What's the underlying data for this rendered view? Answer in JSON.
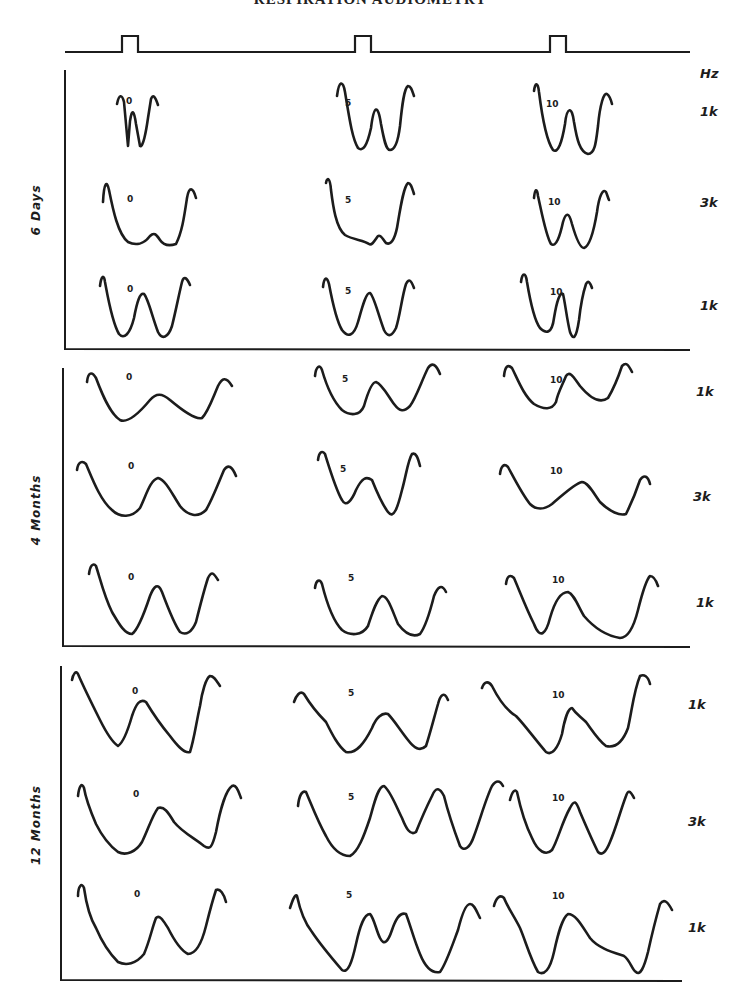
{
  "title": "RESPIRATION AUDIOMETRY",
  "unit_label": "Hz",
  "stimulus": {
    "baseline_y": 52,
    "x_start": 65,
    "x_end": 690,
    "pulses": [
      [
        122,
        138
      ],
      [
        355,
        371
      ],
      [
        550,
        566
      ]
    ],
    "pulse_top_y": 36
  },
  "panels": [
    {
      "label": "6 Days",
      "label_pos": [
        40,
        210
      ],
      "axis": {
        "x": 65,
        "top": 70,
        "bottom": 349,
        "right": 690
      },
      "freq_labels": [
        {
          "text": "1k",
          "x": 700,
          "y": 116
        },
        {
          "text": "3k",
          "x": 700,
          "y": 207
        },
        {
          "text": "1k",
          "x": 700,
          "y": 310
        }
      ],
      "levels": [
        {
          "text": "0",
          "x": 126,
          "y": 104
        },
        {
          "text": "5",
          "x": 345,
          "y": 106
        },
        {
          "text": "10",
          "x": 546,
          "y": 107
        },
        {
          "text": "0",
          "x": 127,
          "y": 202
        },
        {
          "text": "5",
          "x": 345,
          "y": 203
        },
        {
          "text": "10",
          "x": 548,
          "y": 205
        },
        {
          "text": "0",
          "x": 127,
          "y": 292
        },
        {
          "text": "5",
          "x": 345,
          "y": 294
        },
        {
          "text": "10",
          "x": 550,
          "y": 295
        }
      ]
    },
    {
      "label": "4 Months",
      "label_pos": [
        40,
        510
      ],
      "axis": {
        "x": 63,
        "top": 368,
        "bottom": 646,
        "right": 690
      },
      "freq_labels": [
        {
          "text": "1k",
          "x": 696,
          "y": 396
        },
        {
          "text": "3k",
          "x": 693,
          "y": 501
        },
        {
          "text": "1k",
          "x": 696,
          "y": 607
        }
      ],
      "levels": [
        {
          "text": "0",
          "x": 126,
          "y": 380
        },
        {
          "text": "5",
          "x": 342,
          "y": 382
        },
        {
          "text": "10",
          "x": 550,
          "y": 383
        },
        {
          "text": "0",
          "x": 128,
          "y": 469
        },
        {
          "text": "5",
          "x": 340,
          "y": 472
        },
        {
          "text": "10",
          "x": 550,
          "y": 474
        },
        {
          "text": "0",
          "x": 128,
          "y": 580
        },
        {
          "text": "5",
          "x": 348,
          "y": 581
        },
        {
          "text": "10",
          "x": 552,
          "y": 583
        }
      ]
    },
    {
      "label": "12 Months",
      "label_pos": [
        40,
        825
      ],
      "axis": {
        "x": 61,
        "top": 666,
        "bottom": 980,
        "right": 682
      },
      "freq_labels": [
        {
          "text": "1k",
          "x": 688,
          "y": 709
        },
        {
          "text": "3k",
          "x": 688,
          "y": 826
        },
        {
          "text": "1k",
          "x": 688,
          "y": 932
        }
      ],
      "levels": [
        {
          "text": "0",
          "x": 132,
          "y": 694
        },
        {
          "text": "5",
          "x": 348,
          "y": 696
        },
        {
          "text": "10",
          "x": 552,
          "y": 698
        },
        {
          "text": "0",
          "x": 133,
          "y": 797
        },
        {
          "text": "5",
          "x": 348,
          "y": 800
        },
        {
          "text": "10",
          "x": 552,
          "y": 801
        },
        {
          "text": "0",
          "x": 134,
          "y": 897
        },
        {
          "text": "5",
          "x": 346,
          "y": 898
        },
        {
          "text": "10",
          "x": 552,
          "y": 899
        }
      ]
    }
  ],
  "traces": [
    "M117,104 C119,94 122,94 124,102 L128,146 L130,121 C132,108 134,110 136,124 L140,146 C143,148 146,132 148,118 L151,99 C153,94 155,96 158,105",
    "M337,96 C339,80 343,80 345,92 C349,116 352,138 358,148 C363,152 367,146 371,128 C374,104 378,104 381,124 C384,140 386,150 390,150 C395,150 398,142 400,126 C402,106 404,88 408,86 C411,86 412,90 414,96",
    "M534,91 C535,82 538,82 539,92 C542,116 546,140 553,150 C558,154 562,142 565,124 C567,106 572,106 574,122 C577,140 580,152 588,154 C595,154 596,142 598,126 C600,104 604,92 607,94 C610,96 611,100 612,104",
    "M103,202 C104,182 107,180 109,190 C113,210 118,234 128,242 C136,246 144,244 150,236 C154,232 156,234 160,240 C164,246 170,246 176,244 C182,232 184,218 187,198 C189,186 193,187 196,198",
    "M326,183 C327,177 330,177 331,190 C333,206 336,228 345,235 C353,240 364,240 369,244 C372,246 375,240 378,236 C381,234 383,240 386,243 C392,246 396,236 398,222 C401,204 404,186 408,183 C411,183 412,188 414,194",
    "M534,198 C535,188 537,188 538,196 C542,214 546,236 551,244 C556,248 560,236 563,222 C566,212 569,212 572,224 C576,238 580,248 584,248 C590,246 594,230 597,212 C599,196 603,188 606,192 C607,194 608,198 609,200",
    "M100,286 C101,277 104,273 105,282 C108,298 112,322 119,334 C124,340 130,334 134,318 C137,302 140,292 144,294 C148,298 152,316 158,332 C162,340 168,338 172,326 C176,310 179,294 182,282 C184,275 187,278 190,285",
    "M323,287 C324,277 327,276 329,284 C332,300 336,320 342,330 C348,338 354,336 358,322 C362,308 366,292 370,293 C374,296 378,314 384,330 C388,338 392,336 396,328 C400,316 402,296 406,284 C409,278 411,280 414,288",
    "M521,282 C522,272 526,272 527,282 C530,300 534,320 540,328 C546,334 552,334 554,318 C557,300 560,292 563,294 C565,302 567,320 570,332 C573,340 576,340 579,320 C581,302 584,290 586,284 C588,280 590,282 592,288",
    "M87,382 C88,372 92,371 96,378 C102,394 110,414 120,420 C128,424 140,412 150,400 C156,393 162,393 170,400 C182,410 195,420 202,418 C208,412 212,400 218,386 C222,378 226,376 232,386",
    "M315,376 C316,366 320,364 322,370 C326,384 332,400 342,410 C350,416 360,416 364,406 C368,392 372,382 376,382 C382,384 388,396 394,404 C400,412 404,412 410,406 C416,398 422,380 428,368 C432,362 436,364 440,374",
    "M504,376 C505,366 508,364 512,368 C518,380 524,396 534,404 C544,410 552,410 556,402 C558,392 562,386 566,376 C570,370 574,378 580,386 C590,398 600,404 608,398 C614,388 618,378 622,366 C626,362 628,364 632,372",
    "M77,470 C78,462 82,460 86,464 C92,478 100,500 112,510 C120,518 132,518 140,508 C146,496 150,480 158,478 C166,480 172,494 180,506 C188,516 198,518 206,510 C212,500 218,484 224,470 C228,464 232,466 236,476",
    "M318,460 C319,452 322,450 325,454 C330,470 336,490 342,500 C346,508 352,500 356,490 C362,478 366,476 372,480 C376,490 382,504 388,512 C394,520 398,506 402,490 C406,476 408,460 412,454 C416,452 418,458 420,466",
    "M500,474 C501,466 504,463 508,467 C514,478 522,494 530,504 C536,510 544,510 552,504 C564,494 574,484 582,482 C588,482 594,494 600,502 C610,512 620,516 626,514 C630,506 636,492 640,480 C644,474 648,476 650,484",
    "M89,574 C90,566 93,562 96,566 C100,578 104,596 112,612 C118,622 124,634 132,634 C138,630 144,614 150,596 C154,586 158,582 162,592 C168,608 174,624 180,632 C186,636 192,632 196,622 C200,606 204,590 208,578 C212,570 214,574 218,580",
    "M315,588 C316,580 320,578 322,584 C326,600 332,620 342,630 C350,636 362,636 368,626 C372,614 376,600 382,596 C388,596 392,610 398,624 C404,632 412,638 420,634 C426,626 430,612 434,596 C438,586 442,584 446,592",
    "M506,584 C507,576 510,574 514,578 C520,592 526,608 534,624 C540,640 546,634 550,618 C554,604 560,592 568,592 C574,594 578,606 584,616 C596,630 608,636 620,638 C628,638 634,626 638,610 C642,594 646,580 650,576 C654,576 656,580 658,586",
    "M72,680 C73,674 76,670 78,674 C84,688 92,704 100,720 C106,732 112,742 118,746 C124,742 128,730 132,716 C136,704 140,698 146,702 C152,712 160,724 170,736 C176,744 184,754 190,752 C194,740 196,724 200,706 C202,692 206,678 210,676 C214,676 216,680 220,686",
    "M294,702 C296,696 300,690 304,694 C310,704 318,714 326,722 C332,734 338,746 346,752 C356,754 364,744 372,728 C376,718 382,712 388,714 C394,720 400,730 408,740 C414,748 420,752 426,746 C430,734 434,718 438,704 C440,696 444,690 448,700",
    "M482,688 C484,682 488,680 492,686 C498,698 506,710 516,716 C524,724 534,738 546,752 C552,756 558,748 562,734 C564,722 568,708 572,708 C576,714 580,716 586,722 C592,730 598,740 606,746 C614,748 622,744 628,728 C632,710 634,690 640,676 C644,674 648,676 650,684",
    "M78,796 C79,786 82,782 84,788 C86,800 90,810 96,824 C102,836 110,846 118,852 C126,856 136,852 142,842 C148,830 152,816 158,808 C164,806 168,812 174,822 C182,832 194,838 204,846 C210,850 212,848 216,832 C220,810 226,790 232,786 C236,784 238,790 241,798",
    "M298,806 C299,796 302,790 306,792 C312,806 318,822 326,836 C332,848 340,856 350,856 C358,852 364,836 370,818 C374,804 378,786 384,786 C390,790 396,806 402,818 C406,828 410,836 416,832 C420,822 426,808 432,796 C436,786 440,788 444,796 C448,812 454,830 460,846 C464,852 470,848 474,836 C480,820 486,798 492,786 C496,780 500,780 503,786",
    "M510,800 C512,792 515,788 517,792 C520,806 524,822 532,838 C538,852 546,856 552,850 C558,840 562,822 570,808 C574,800 576,800 580,812 C586,826 592,840 598,852 C602,856 606,852 610,842 C616,828 620,812 626,796 C628,790 630,790 634,798",
    "M78,896 C78,886 82,882 84,888 C86,902 90,918 96,928 C102,942 110,954 118,962 C126,966 136,964 144,954 C150,940 152,928 156,918 C160,914 164,922 168,928 C174,940 180,950 188,954 C196,954 202,942 206,926 C210,910 214,896 216,890 C220,888 224,894 226,902",
    "M290,908 C292,902 295,893 297,896 C300,910 304,922 312,932 C320,944 330,956 342,970 C348,974 352,962 356,944 C360,926 364,914 370,914 C374,918 376,930 380,938 C384,946 388,942 392,930 C396,918 400,912 406,914 C410,924 414,940 420,954 C424,964 430,974 440,972 C446,964 452,946 458,930 C462,914 466,904 470,904 C474,904 476,910 480,918",
    "M494,906 C496,898 500,894 504,898 C508,908 514,916 520,928 C526,942 530,958 538,972 C544,976 550,970 554,952 C558,934 562,918 568,914 C576,914 582,926 590,938 C598,948 612,952 624,956 C630,960 632,970 636,972 C640,976 644,968 648,952 C652,934 656,918 660,904 C664,898 668,902 672,910"
  ]
}
